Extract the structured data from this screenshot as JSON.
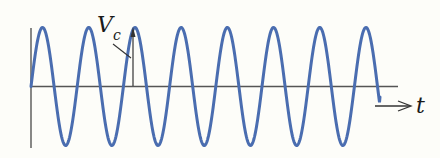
{
  "diagram": {
    "type": "sinusoidal-signal",
    "labels": {
      "amplitude": "V",
      "amplitude_subscript": "c",
      "time_axis": "t"
    },
    "colors": {
      "background": "#fdfdf9",
      "wave": "#4a6db0",
      "axes": "#555555",
      "text": "#1a1a1a"
    },
    "wave": {
      "cycles": 7.5,
      "peaks": 8
    }
  }
}
